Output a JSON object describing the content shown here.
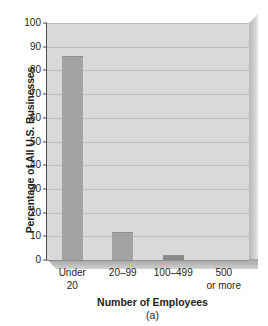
{
  "chart_data": {
    "type": "bar",
    "title": "",
    "xlabel": "Number of Employees",
    "ylabel": "Percentage of All U.S. Businesses",
    "panel_label": "(a)",
    "categories": [
      "Under 20",
      "20–99",
      "100–499",
      "500 or more"
    ],
    "category_lines": [
      [
        "Under",
        "20"
      ],
      [
        "20–99",
        ""
      ],
      [
        "100–499",
        ""
      ],
      [
        "500",
        "or more"
      ]
    ],
    "values": [
      86,
      12,
      2,
      0
    ],
    "ylim": [
      0,
      100
    ],
    "ytick_step": 10,
    "yticks": [
      "0",
      "10",
      "20",
      "30",
      "40",
      "50",
      "60",
      "70",
      "80",
      "90",
      "100"
    ],
    "grid": true,
    "legend": "none",
    "colors": {
      "bar": "#a3a3a3",
      "bar_small": "#8a8a8a",
      "plot_background": "#d9d9d9",
      "gridline": "#bdbdbd",
      "axis": "#4b4b4b",
      "text": "#231f20",
      "page_background": "#ffffff"
    }
  }
}
